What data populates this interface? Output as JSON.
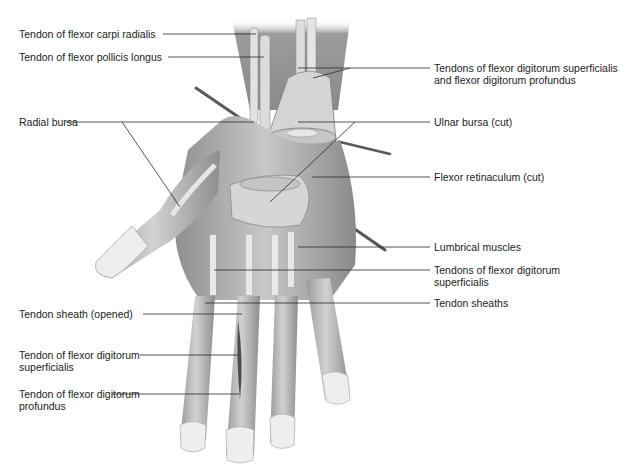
{
  "figure": {
    "colors": {
      "background": "#ffffff",
      "tissue_light": "#d9d9d9",
      "tissue_mid": "#a8a8a8",
      "tissue_dark": "#6e6e6e",
      "nail": "#ececec",
      "leader_line": "#2a2a2a"
    }
  },
  "labels": {
    "left": [
      {
        "text": "Tendon of flexor carpi radialis",
        "x": 19,
        "y": 28
      },
      {
        "text": "Tendon of flexor pollicis longus",
        "x": 19,
        "y": 51
      },
      {
        "text": "Radial bursa",
        "x": 19,
        "y": 116
      },
      {
        "text": "Tendon sheath (opened)",
        "x": 19,
        "y": 308
      },
      {
        "text": "Tendon of flexor digitorum\nsuperficialis",
        "x": 19,
        "y": 349
      },
      {
        "text": "Tendon of flexor digitorum\nprofundus",
        "x": 19,
        "y": 388
      }
    ],
    "right": [
      {
        "text": "Tendons of flexor digitorum superficialis\nand flexor digitorum profundus",
        "x": 434,
        "y": 62
      },
      {
        "text": "Ulnar bursa (cut)",
        "x": 434,
        "y": 116
      },
      {
        "text": "Flexor retinaculum (cut)",
        "x": 434,
        "y": 171
      },
      {
        "text": "Lumbrical muscles",
        "x": 434,
        "y": 241
      },
      {
        "text": "Tendons of flexor digitorum\nsuperficialis",
        "x": 434,
        "y": 264
      },
      {
        "text": "Tendon sheaths",
        "x": 434,
        "y": 297
      }
    ]
  }
}
